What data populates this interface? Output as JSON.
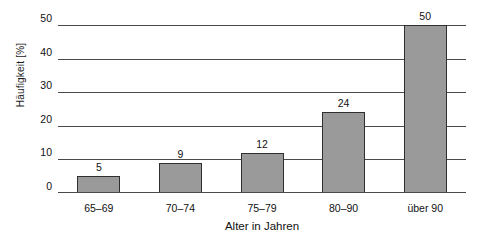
{
  "chart_data": {
    "type": "bar",
    "title": "",
    "subtitle": "",
    "xlabel": "Alter in Jahren",
    "ylabel": "Häufigkeit [%]",
    "categories": [
      "65–69",
      "70–74",
      "75–79",
      "80–90",
      "über 90"
    ],
    "values": [
      5,
      9,
      12,
      24,
      50
    ],
    "value_labels": [
      "5",
      "9",
      "12",
      "24",
      "50"
    ],
    "ylim": [
      0,
      50
    ],
    "yticks": [
      0,
      10,
      20,
      30,
      40,
      50
    ],
    "ytick_labels": [
      "0",
      "10",
      "20",
      "30",
      "40",
      "50"
    ],
    "grid": true,
    "grid_axis": "y",
    "legend": false,
    "legend_position": "none",
    "series": [
      {
        "name": "Häufigkeit",
        "values": [
          5,
          9,
          12,
          24,
          50
        ]
      }
    ]
  },
  "style": {
    "background_color": "#ffffff",
    "bar_fill_color": "#9a9a9a",
    "bar_border_color": "#2f2f2f",
    "gridline_color": "#4a4a4a",
    "text_color": "#111111"
  }
}
